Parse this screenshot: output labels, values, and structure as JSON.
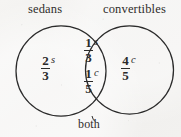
{
  "figure": {
    "type": "venn-diagram",
    "stroke_color": "#2b2b2b",
    "background_color": "#f3f2f0",
    "left_set_label": "sedans",
    "right_set_label": "convertibles",
    "intersection_label": "both"
  },
  "regions": {
    "left_only": {
      "numerator": "2",
      "denominator": "3",
      "variable": "s"
    },
    "right_only": {
      "numerator": "4",
      "denominator": "5",
      "variable": "c"
    },
    "intersection_top": {
      "numerator": "1",
      "denominator": "3",
      "variable": "s"
    },
    "intersection_bottom": {
      "numerator": "1",
      "denominator": "5",
      "variable": "c"
    }
  }
}
